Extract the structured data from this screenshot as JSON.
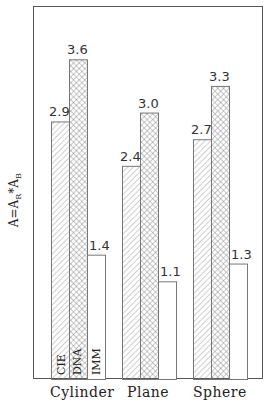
{
  "chart_data": {
    "type": "bar",
    "title": "",
    "xlabel": "",
    "ylabel": "A=A_R*A_B",
    "categories": [
      "Cylinder",
      "Plane",
      "Sphere"
    ],
    "series": [
      {
        "name": "CIE",
        "pattern": "diagonal-hatch",
        "values": [
          2.9,
          2.4,
          2.7
        ]
      },
      {
        "name": "DNA",
        "pattern": "cross-hatch",
        "values": [
          3.6,
          3.0,
          3.3
        ]
      },
      {
        "name": "IMM",
        "pattern": "empty",
        "values": [
          1.4,
          1.1,
          1.3
        ]
      }
    ],
    "ylim": [
      0,
      4.2
    ],
    "grid": false,
    "legend": "series names written vertically inside the Cylinder bars",
    "value_labels": [
      [
        "2.9",
        "3.6",
        "1.4"
      ],
      [
        "2.4",
        "3.0",
        "1.1"
      ],
      [
        "2.7",
        "3.3",
        "1.3"
      ]
    ]
  },
  "ylabel_parts": {
    "main": "A=A",
    "sub1": "R",
    "mid": "*A",
    "sub2": "B"
  }
}
